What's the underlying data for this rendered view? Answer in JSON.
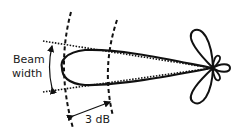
{
  "diagram": {
    "labels": {
      "beam_width_line1": "Beam",
      "beam_width_line2": "width",
      "attenuation": "3 dB"
    },
    "elements": [
      "main-lobe",
      "side-lobes",
      "half-power-dotted-lines",
      "dashed-arcs",
      "beam-width-arrow",
      "3db-arrow"
    ],
    "colors": {
      "stroke": "#111111",
      "background": "#ffffff"
    }
  }
}
